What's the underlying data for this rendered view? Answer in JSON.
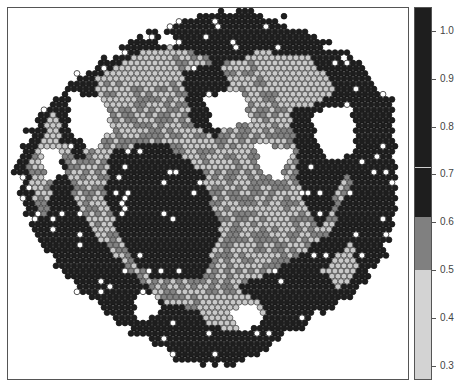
{
  "chart_data": {
    "type": "heatmap",
    "subtype": "spatial spot plot (hexagonal grid of tissue spots)",
    "title": "",
    "xlabel": "",
    "ylabel": "",
    "grid": false,
    "legend_position": "right (colorbar)",
    "colorbar": {
      "range": [
        0.27,
        1.05
      ],
      "ticks": [
        1.0,
        0.9,
        0.8,
        0.7,
        0.6,
        0.5,
        0.4,
        0.3
      ],
      "tick_labels": [
        "1.0",
        "0.9",
        "0.8",
        "0.7",
        "0.6",
        "0.5",
        "0.4",
        "0.3"
      ],
      "bins": [
        {
          "from": 0.27,
          "to": 0.5,
          "color": "#d3d3d3",
          "label": "light gray"
        },
        {
          "from": 0.5,
          "to": 0.61,
          "color": "#808080",
          "label": "mid gray"
        },
        {
          "from": 0.61,
          "to": 0.715,
          "color": "#1e1e1e",
          "label": "dark"
        },
        {
          "from": 0.715,
          "to": 1.05,
          "color": "#1e1e1e",
          "label": "dark"
        }
      ],
      "divider_at": 0.715
    },
    "spot_colors": {
      "high": "#1e1e1e",
      "mid": "#828282",
      "low": "#c8c8c8",
      "spot_outline": "#3a3a3a",
      "white_spot": "#ffffff"
    },
    "spot_grid": {
      "spacing_x": 6,
      "spacing_y": 5.2,
      "radius": 2.9
    },
    "tissue_outline": [
      [
        40,
        110
      ],
      [
        70,
        80
      ],
      [
        110,
        55
      ],
      [
        150,
        30
      ],
      [
        200,
        12
      ],
      [
        240,
        10
      ],
      [
        280,
        18
      ],
      [
        320,
        40
      ],
      [
        360,
        65
      ],
      [
        390,
        100
      ],
      [
        395,
        160
      ],
      [
        395,
        220
      ],
      [
        380,
        260
      ],
      [
        350,
        295
      ],
      [
        310,
        320
      ],
      [
        270,
        345
      ],
      [
        230,
        365
      ],
      [
        180,
        360
      ],
      [
        130,
        330
      ],
      [
        80,
        290
      ],
      [
        45,
        250
      ],
      [
        20,
        200
      ],
      [
        12,
        160
      ]
    ],
    "regions_mid": [
      [
        [
          60,
          110
        ],
        [
          110,
          65
        ],
        [
          170,
          45
        ],
        [
          220,
          60
        ],
        [
          260,
          55
        ],
        [
          300,
          70
        ],
        [
          330,
          110
        ],
        [
          350,
          180
        ],
        [
          330,
          230
        ],
        [
          290,
          260
        ],
        [
          250,
          280
        ],
        [
          200,
          310
        ],
        [
          160,
          300
        ],
        [
          130,
          270
        ],
        [
          100,
          240
        ],
        [
          75,
          200
        ],
        [
          60,
          150
        ]
      ],
      [
        [
          15,
          170
        ],
        [
          40,
          130
        ],
        [
          55,
          150
        ],
        [
          45,
          220
        ],
        [
          30,
          220
        ]
      ]
    ],
    "regions_low": [
      [
        [
          70,
          60
        ],
        [
          120,
          45
        ],
        [
          160,
          50
        ],
        [
          190,
          75
        ],
        [
          150,
          90
        ],
        [
          110,
          80
        ],
        [
          80,
          75
        ]
      ],
      [
        [
          250,
          50
        ],
        [
          310,
          55
        ],
        [
          335,
          90
        ],
        [
          300,
          110
        ],
        [
          270,
          90
        ]
      ],
      [
        [
          30,
          110
        ],
        [
          60,
          100
        ],
        [
          70,
          140
        ],
        [
          50,
          170
        ],
        [
          30,
          150
        ]
      ],
      [
        [
          200,
          300
        ],
        [
          240,
          290
        ],
        [
          270,
          310
        ],
        [
          230,
          330
        ],
        [
          200,
          320
        ]
      ],
      [
        [
          320,
          270
        ],
        [
          350,
          240
        ],
        [
          360,
          270
        ],
        [
          340,
          290
        ]
      ]
    ],
    "regions_dark_inner": [
      [
        [
          110,
          150
        ],
        [
          160,
          140
        ],
        [
          200,
          170
        ],
        [
          220,
          230
        ],
        [
          200,
          280
        ],
        [
          150,
          280
        ],
        [
          120,
          240
        ],
        [
          105,
          195
        ]
      ],
      [
        [
          180,
          70
        ],
        [
          220,
          60
        ],
        [
          235,
          110
        ],
        [
          215,
          140
        ],
        [
          190,
          120
        ]
      ],
      [
        [
          290,
          110
        ],
        [
          330,
          100
        ],
        [
          345,
          170
        ],
        [
          320,
          230
        ],
        [
          300,
          200
        ],
        [
          295,
          150
        ]
      ],
      [
        [
          55,
          85
        ],
        [
          95,
          75
        ],
        [
          100,
          120
        ],
        [
          80,
          160
        ],
        [
          60,
          140
        ]
      ]
    ],
    "holes": [
      [
        [
          70,
          90
        ],
        [
          105,
          100
        ],
        [
          110,
          130
        ],
        [
          90,
          150
        ],
        [
          70,
          130
        ]
      ],
      [
        [
          200,
          95
        ],
        [
          240,
          90
        ],
        [
          250,
          120
        ],
        [
          215,
          130
        ]
      ],
      [
        [
          255,
          140
        ],
        [
          290,
          150
        ],
        [
          280,
          180
        ],
        [
          260,
          170
        ]
      ],
      [
        [
          310,
          110
        ],
        [
          350,
          105
        ],
        [
          355,
          150
        ],
        [
          330,
          160
        ],
        [
          315,
          135
        ]
      ],
      [
        [
          40,
          150
        ],
        [
          60,
          150
        ],
        [
          62,
          175
        ],
        [
          45,
          180
        ]
      ],
      [
        [
          130,
          300
        ],
        [
          150,
          290
        ],
        [
          160,
          310
        ],
        [
          140,
          320
        ]
      ],
      [
        [
          230,
          310
        ],
        [
          255,
          300
        ],
        [
          265,
          320
        ],
        [
          240,
          330
        ]
      ],
      [
        [
          160,
          30
        ],
        [
          175,
          35
        ],
        [
          172,
          45
        ],
        [
          160,
          42
        ]
      ]
    ]
  }
}
